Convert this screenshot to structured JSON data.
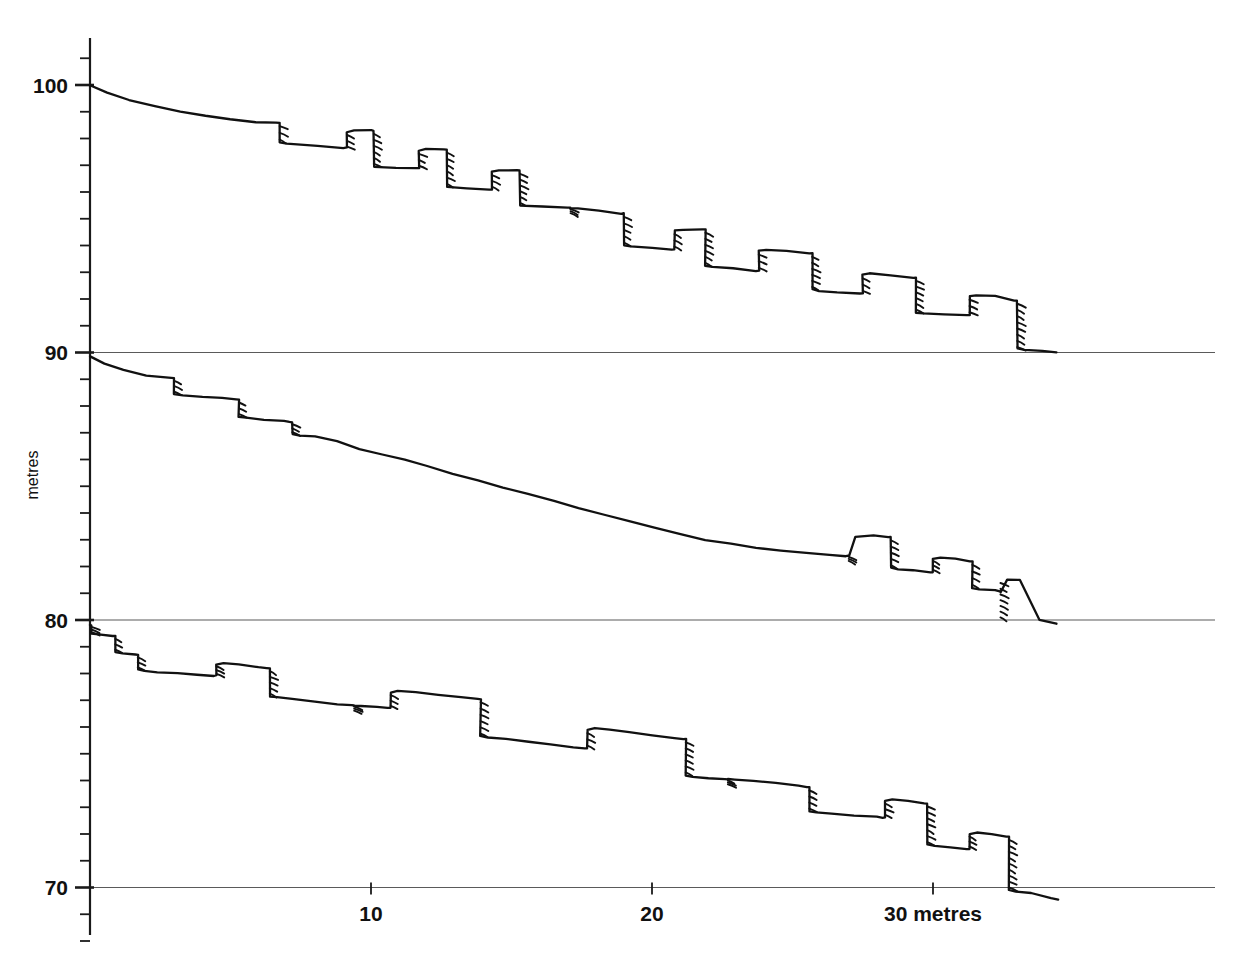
{
  "figure": {
    "kind": "terrace-profile-survey",
    "background_color": "#ffffff",
    "line_color": "#111111",
    "gridline_color": "#5a5a5a"
  },
  "axes": {
    "y_axis_title": "metres",
    "x_axis_unit_label": "metres",
    "y_major_labels": [
      "100",
      "90",
      "80",
      "70"
    ],
    "x_major_labels": [
      "10",
      "20",
      "30 metres"
    ]
  },
  "chart_data": {
    "type": "line",
    "title": "",
    "subtitle": "",
    "xlabel": "metres",
    "ylabel": "metres",
    "xlim": [
      0,
      34.5
    ],
    "ylim": [
      66.5,
      101.5
    ],
    "grid": true,
    "gridlines_y": [
      90,
      80,
      70
    ],
    "legend_position": "none",
    "annotations": [],
    "x_ticks_major": [
      10,
      20,
      30
    ],
    "x_tick_labels": [
      "10",
      "20",
      "30 metres"
    ],
    "x_ticks_minor": [
      1,
      2,
      3,
      4,
      5,
      6,
      7,
      8,
      9,
      11,
      12,
      13,
      14,
      15,
      16,
      17,
      18,
      19,
      21,
      22,
      23,
      24,
      25,
      26,
      27,
      28,
      29,
      31,
      32,
      33,
      34
    ],
    "y_ticks_major": [
      100,
      90,
      80,
      70
    ],
    "y_tick_labels": [
      "100",
      "90",
      "80",
      "70"
    ],
    "y_ticks_minor": [
      101,
      99,
      98,
      97,
      96,
      95,
      94,
      93,
      92,
      91,
      89,
      88,
      87,
      86,
      85,
      84,
      83,
      82,
      81,
      79,
      78,
      77,
      76,
      75,
      74,
      73,
      72,
      71,
      69,
      68
    ],
    "series": [
      {
        "name": "profile-upper",
        "style": "hachured-terrace-profile",
        "x": [
          0.0,
          0.6,
          1.4,
          2.3,
          3.2,
          4.1,
          5.0,
          5.9,
          6.6,
          6.75,
          6.75,
          7.0,
          8.1,
          9.0,
          9.15,
          9.15,
          9.4,
          10.0,
          10.1,
          10.1,
          10.9,
          11.6,
          11.7,
          11.7,
          11.95,
          12.6,
          12.7,
          12.7,
          13.4,
          14.2,
          14.3,
          14.3,
          14.55,
          15.2,
          15.3,
          15.3,
          16.1,
          17.0,
          17.1,
          17.1,
          17.35,
          18.1,
          18.9,
          19.0,
          19.0,
          19.25,
          20.0,
          20.7,
          20.8,
          20.8,
          21.1,
          21.8,
          21.9,
          21.9,
          22.15,
          22.9,
          23.7,
          23.8,
          23.8,
          24.05,
          24.8,
          25.6,
          25.7,
          25.7,
          25.95,
          26.6,
          27.4,
          27.5,
          27.5,
          27.75,
          28.5,
          29.3,
          29.4,
          29.4,
          29.65,
          30.4,
          31.2,
          31.3,
          31.3,
          31.55,
          32.2,
          32.9,
          33.0,
          33.0,
          33.25,
          33.9,
          34.4
        ],
        "y": [
          100.0,
          99.72,
          99.45,
          99.2,
          99.0,
          98.85,
          98.72,
          98.62,
          98.6,
          98.6,
          97.85,
          97.8,
          97.72,
          97.65,
          97.65,
          98.25,
          98.3,
          98.3,
          98.3,
          96.95,
          96.9,
          96.88,
          96.88,
          97.55,
          97.6,
          97.6,
          97.6,
          96.2,
          96.15,
          96.1,
          96.1,
          96.75,
          96.8,
          96.8,
          96.8,
          95.5,
          95.45,
          95.42,
          95.4,
          95.4,
          95.4,
          95.3,
          95.2,
          95.2,
          94.0,
          93.95,
          93.9,
          93.85,
          93.85,
          94.55,
          94.6,
          94.6,
          94.6,
          93.25,
          93.2,
          93.15,
          93.05,
          93.05,
          93.8,
          93.85,
          93.8,
          93.7,
          93.7,
          92.35,
          92.3,
          92.25,
          92.2,
          92.2,
          92.9,
          92.95,
          92.9,
          92.8,
          92.8,
          91.5,
          91.45,
          91.42,
          91.4,
          91.4,
          92.1,
          92.15,
          92.1,
          91.95,
          91.95,
          90.15,
          90.1,
          90.05,
          90.0
        ],
        "hachures": [
          {
            "x": 6.75,
            "y_top": 98.6,
            "y_bot": 97.85
          },
          {
            "x": 9.15,
            "y_top": 98.25,
            "y_bot": 97.6
          },
          {
            "x": 10.1,
            "y_top": 98.3,
            "y_bot": 96.95
          },
          {
            "x": 11.7,
            "y_top": 97.55,
            "y_bot": 96.88
          },
          {
            "x": 12.7,
            "y_top": 97.6,
            "y_bot": 96.2
          },
          {
            "x": 14.3,
            "y_top": 96.75,
            "y_bot": 96.1
          },
          {
            "x": 15.3,
            "y_top": 96.8,
            "y_bot": 95.5
          },
          {
            "x": 17.1,
            "y_top": 95.4,
            "y_bot": 95.4
          },
          {
            "x": 19.0,
            "y_top": 95.2,
            "y_bot": 94.0
          },
          {
            "x": 20.8,
            "y_top": 94.55,
            "y_bot": 93.85
          },
          {
            "x": 21.9,
            "y_top": 94.6,
            "y_bot": 93.25
          },
          {
            "x": 23.8,
            "y_top": 93.8,
            "y_bot": 93.05
          },
          {
            "x": 25.7,
            "y_top": 93.7,
            "y_bot": 92.35
          },
          {
            "x": 27.5,
            "y_top": 92.9,
            "y_bot": 92.2
          },
          {
            "x": 29.4,
            "y_top": 92.8,
            "y_bot": 91.5
          },
          {
            "x": 31.3,
            "y_top": 92.1,
            "y_bot": 91.4
          },
          {
            "x": 33.0,
            "y_top": 91.95,
            "y_bot": 90.1
          }
        ]
      },
      {
        "name": "profile-middle",
        "style": "hachured-terrace-profile",
        "x": [
          0.0,
          0.5,
          1.2,
          2.0,
          2.8,
          3.0,
          3.0,
          3.3,
          4.0,
          4.7,
          5.2,
          5.3,
          5.3,
          5.55,
          6.2,
          6.9,
          7.1,
          7.2,
          7.2,
          7.45,
          8.0,
          8.8,
          9.6,
          10.4,
          11.2,
          12.0,
          12.9,
          13.8,
          14.7,
          15.6,
          16.5,
          17.4,
          18.3,
          19.2,
          20.1,
          21.0,
          21.9,
          22.8,
          23.7,
          24.6,
          25.5,
          26.3,
          26.9,
          27.0,
          27.0,
          27.25,
          27.9,
          28.4,
          28.5,
          28.5,
          28.75,
          29.3,
          29.9,
          30.0,
          30.0,
          30.25,
          30.8,
          31.3,
          31.4,
          31.4,
          31.65,
          32.2,
          32.4,
          32.4,
          32.65,
          33.1,
          33.8,
          34.4
        ],
        "y": [
          89.85,
          89.6,
          89.35,
          89.15,
          89.05,
          89.05,
          88.45,
          88.4,
          88.35,
          88.3,
          88.25,
          88.25,
          87.6,
          87.55,
          87.5,
          87.45,
          87.4,
          87.4,
          86.95,
          86.9,
          86.85,
          86.7,
          86.4,
          86.2,
          86.0,
          85.75,
          85.45,
          85.2,
          84.95,
          84.7,
          84.45,
          84.2,
          83.95,
          83.7,
          83.45,
          83.2,
          83.0,
          82.85,
          82.7,
          82.6,
          82.5,
          82.45,
          82.4,
          82.4,
          82.4,
          83.1,
          83.15,
          83.1,
          83.1,
          81.95,
          81.9,
          81.85,
          81.8,
          81.8,
          82.3,
          82.35,
          82.3,
          82.2,
          82.2,
          81.2,
          81.15,
          81.1,
          81.05,
          81.05,
          81.5,
          81.5,
          80.0,
          79.85
        ],
        "hachures": [
          {
            "x": 3.0,
            "y_top": 89.05,
            "y_bot": 88.45
          },
          {
            "x": 5.3,
            "y_top": 88.25,
            "y_bot": 87.6
          },
          {
            "x": 7.2,
            "y_top": 87.4,
            "y_bot": 86.95
          },
          {
            "x": 27.0,
            "y_top": 82.4,
            "y_bot": 82.4
          },
          {
            "x": 28.5,
            "y_top": 83.1,
            "y_bot": 81.95
          },
          {
            "x": 30.0,
            "y_top": 82.3,
            "y_bot": 81.8
          },
          {
            "x": 31.4,
            "y_top": 82.2,
            "y_bot": 81.2
          },
          {
            "x": 32.4,
            "y_top": 81.5,
            "y_bot": 80.0
          }
        ]
      },
      {
        "name": "profile-lower",
        "style": "hachured-terrace-profile",
        "x": [
          0.0,
          0.05,
          0.05,
          0.3,
          0.8,
          0.9,
          0.9,
          1.15,
          1.6,
          1.7,
          1.7,
          1.95,
          2.4,
          3.1,
          3.8,
          4.4,
          4.5,
          4.5,
          4.75,
          5.3,
          6.0,
          6.3,
          6.4,
          6.4,
          6.65,
          7.2,
          8.0,
          8.8,
          9.3,
          9.4,
          9.4,
          9.65,
          10.2,
          10.6,
          10.7,
          10.7,
          10.95,
          11.6,
          12.4,
          13.2,
          13.8,
          13.9,
          13.9,
          14.15,
          14.8,
          15.6,
          16.4,
          17.2,
          17.6,
          17.7,
          17.7,
          17.95,
          18.5,
          19.2,
          20.0,
          20.8,
          21.1,
          21.2,
          21.2,
          21.45,
          22.0,
          22.6,
          22.7,
          22.7,
          22.95,
          23.6,
          24.4,
          25.2,
          25.5,
          25.6,
          25.6,
          25.85,
          26.4,
          27.2,
          28.0,
          28.2,
          28.3,
          28.3,
          28.55,
          29.1,
          29.7,
          29.8,
          29.8,
          30.05,
          30.6,
          31.2,
          31.3,
          31.3,
          31.55,
          32.1,
          32.6,
          32.7,
          32.7,
          32.95,
          33.5,
          34.2,
          34.45
        ],
        "y": [
          79.8,
          79.8,
          79.5,
          79.45,
          79.4,
          79.4,
          78.8,
          78.75,
          78.7,
          78.7,
          78.15,
          78.1,
          78.05,
          78.0,
          77.95,
          77.92,
          77.92,
          78.35,
          78.4,
          78.35,
          78.25,
          78.2,
          78.2,
          77.15,
          77.1,
          77.05,
          76.95,
          76.85,
          76.8,
          76.8,
          76.8,
          76.8,
          76.75,
          76.7,
          76.7,
          77.3,
          77.35,
          77.3,
          77.2,
          77.1,
          77.05,
          77.05,
          75.65,
          75.6,
          75.55,
          75.45,
          75.35,
          75.25,
          75.2,
          75.2,
          75.9,
          75.95,
          75.9,
          75.8,
          75.7,
          75.6,
          75.55,
          75.55,
          74.2,
          74.15,
          74.1,
          74.05,
          74.05,
          74.05,
          74.05,
          74.0,
          73.9,
          73.8,
          73.75,
          73.75,
          72.85,
          72.8,
          72.75,
          72.7,
          72.65,
          72.62,
          72.62,
          73.25,
          73.3,
          73.25,
          73.15,
          73.15,
          71.6,
          71.55,
          71.5,
          71.45,
          71.45,
          72.0,
          72.05,
          72.0,
          71.9,
          71.9,
          69.9,
          69.85,
          69.8,
          69.6,
          69.55
        ],
        "hachures": [
          {
            "x": 0.05,
            "y_top": 79.8,
            "y_bot": 79.5
          },
          {
            "x": 0.9,
            "y_top": 79.4,
            "y_bot": 78.8
          },
          {
            "x": 1.7,
            "y_top": 78.7,
            "y_bot": 78.15
          },
          {
            "x": 4.5,
            "y_top": 78.35,
            "y_bot": 77.92
          },
          {
            "x": 6.4,
            "y_top": 78.2,
            "y_bot": 77.15
          },
          {
            "x": 9.4,
            "y_top": 76.8,
            "y_bot": 76.8
          },
          {
            "x": 10.7,
            "y_top": 77.3,
            "y_bot": 76.7
          },
          {
            "x": 13.9,
            "y_top": 77.05,
            "y_bot": 75.65
          },
          {
            "x": 17.7,
            "y_top": 75.9,
            "y_bot": 75.2
          },
          {
            "x": 21.2,
            "y_top": 75.55,
            "y_bot": 74.2
          },
          {
            "x": 22.7,
            "y_top": 74.05,
            "y_bot": 74.05
          },
          {
            "x": 25.6,
            "y_top": 73.75,
            "y_bot": 72.85
          },
          {
            "x": 28.3,
            "y_top": 73.25,
            "y_bot": 72.62
          },
          {
            "x": 29.8,
            "y_top": 73.15,
            "y_bot": 71.6
          },
          {
            "x": 31.3,
            "y_top": 72.0,
            "y_bot": 71.45
          },
          {
            "x": 32.7,
            "y_top": 71.9,
            "y_bot": 69.9
          }
        ]
      }
    ]
  }
}
